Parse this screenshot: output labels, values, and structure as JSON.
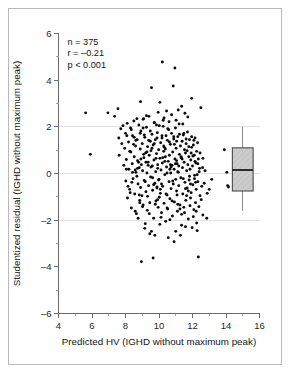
{
  "figure": {
    "border_color": "#b9b9b9",
    "background": "#ffffff"
  },
  "annotations": {
    "n_label": "n = 375",
    "r_label": "r = –0.21",
    "p_label": "p < 0.001"
  },
  "chart_data": {
    "type": "scatter",
    "title": "",
    "subtitle": "",
    "xlabel": "Predicted HV (IGHD without maximum peak)",
    "ylabel": "Studentized residual (IGHD without maximum peak)",
    "xlim": [
      4,
      16
    ],
    "ylim": [
      -6,
      6
    ],
    "xticks": [
      4,
      6,
      8,
      10,
      12,
      14,
      16
    ],
    "xtick_labels": [
      "4",
      "6",
      "8",
      "10",
      "12",
      "14",
      "16"
    ],
    "xminor_ticks": [
      5,
      7,
      9,
      11,
      13,
      15
    ],
    "yticks": [
      -6,
      -4,
      -2,
      0,
      2,
      4,
      6
    ],
    "ytick_labels": [
      "–6",
      "–4",
      "–2",
      "0",
      "2",
      "4",
      "6"
    ],
    "yminor_ticks": [
      -5,
      -3,
      -1,
      1,
      3,
      5
    ],
    "grid": true,
    "gridlines_y": [
      2,
      0,
      -2
    ],
    "legend": "none",
    "n": 375,
    "correlation_r": -0.21,
    "p_value": "< 0.001",
    "point_color": "#0a0a0a",
    "point_radius": 1.45,
    "annotations_text": [
      "n = 375",
      "r = –0.21",
      "p < 0.001"
    ],
    "boxplot": {
      "x_position": 15.0,
      "half_width": 0.62,
      "min_whisker": -1.62,
      "q1": -0.75,
      "median": 0.15,
      "q3": 1.1,
      "max_whisker": 2.0,
      "fill": "#c9c9c9",
      "hatch": "diagonal",
      "edge_color": "#4a4a4a"
    },
    "points": [
      [
        5.62,
        2.6
      ],
      [
        5.9,
        0.82
      ],
      [
        6.95,
        2.6
      ],
      [
        7.35,
        2.45
      ],
      [
        7.55,
        2.78
      ],
      [
        7.6,
        1.52
      ],
      [
        7.62,
        0.78
      ],
      [
        7.78,
        1.28
      ],
      [
        7.85,
        2.05
      ],
      [
        7.9,
        0.35
      ],
      [
        7.95,
        1.08
      ],
      [
        8.0,
        1.72
      ],
      [
        8.02,
        -0.32
      ],
      [
        8.05,
        0.6
      ],
      [
        8.1,
        2.15
      ],
      [
        8.12,
        -1.05
      ],
      [
        8.18,
        1.35
      ],
      [
        8.2,
        0.18
      ],
      [
        8.25,
        -0.68
      ],
      [
        8.3,
        1.95
      ],
      [
        8.32,
        0.92
      ],
      [
        8.35,
        -1.48
      ],
      [
        8.4,
        0.42
      ],
      [
        8.42,
        1.62
      ],
      [
        8.45,
        -0.22
      ],
      [
        8.5,
        2.25
      ],
      [
        8.52,
        0.72
      ],
      [
        8.55,
        -0.88
      ],
      [
        8.6,
        1.18
      ],
      [
        8.62,
        0.05
      ],
      [
        8.65,
        -1.72
      ],
      [
        8.7,
        1.45
      ],
      [
        8.72,
        0.55
      ],
      [
        8.75,
        -0.45
      ],
      [
        8.8,
        2.08
      ],
      [
        8.82,
        0.25
      ],
      [
        8.85,
        -1.15
      ],
      [
        8.88,
        1.05
      ],
      [
        8.9,
        -0.6
      ],
      [
        8.92,
        1.82
      ],
      [
        8.95,
        0.38
      ],
      [
        8.98,
        -0.95
      ],
      [
        9.0,
        1.28
      ],
      [
        9.02,
        0.12
      ],
      [
        9.05,
        -1.35
      ],
      [
        9.08,
        2.35
      ],
      [
        9.1,
        0.68
      ],
      [
        9.12,
        -0.3
      ],
      [
        9.15,
        1.55
      ],
      [
        9.18,
        -2.15
      ],
      [
        9.2,
        0.88
      ],
      [
        9.22,
        -0.78
      ],
      [
        9.25,
        1.98
      ],
      [
        9.28,
        0.02
      ],
      [
        9.3,
        -1.58
      ],
      [
        9.32,
        1.15
      ],
      [
        9.35,
        0.48
      ],
      [
        9.38,
        -0.52
      ],
      [
        9.4,
        2.45
      ],
      [
        9.42,
        0.78
      ],
      [
        9.45,
        -1.25
      ],
      [
        9.48,
        1.38
      ],
      [
        9.5,
        -0.15
      ],
      [
        9.52,
        0.98
      ],
      [
        9.55,
        -2.48
      ],
      [
        9.58,
        1.68
      ],
      [
        9.6,
        0.32
      ],
      [
        9.62,
        -0.72
      ],
      [
        9.65,
        1.22
      ],
      [
        9.68,
        -1.92
      ],
      [
        9.7,
        0.58
      ],
      [
        9.72,
        2.18
      ],
      [
        9.75,
        -0.42
      ],
      [
        9.78,
        1.45
      ],
      [
        9.8,
        0.08
      ],
      [
        9.82,
        -1.18
      ],
      [
        9.85,
        0.85
      ],
      [
        9.88,
        -0.62
      ],
      [
        9.9,
        1.75
      ],
      [
        9.92,
        0.22
      ],
      [
        9.95,
        -1.45
      ],
      [
        9.98,
        1.02
      ],
      [
        10.0,
        -0.25
      ],
      [
        10.02,
        2.05
      ],
      [
        10.05,
        0.65
      ],
      [
        10.08,
        -0.85
      ],
      [
        10.1,
        1.32
      ],
      [
        10.12,
        0.15
      ],
      [
        10.15,
        -1.68
      ],
      [
        10.18,
        1.52
      ],
      [
        10.2,
        0.45
      ],
      [
        10.22,
        -0.55
      ],
      [
        10.25,
        2.28
      ],
      [
        10.28,
        0.95
      ],
      [
        10.3,
        -1.28
      ],
      [
        10.32,
        1.12
      ],
      [
        10.35,
        -0.05
      ],
      [
        10.38,
        0.72
      ],
      [
        10.4,
        -2.05
      ],
      [
        10.42,
        1.62
      ],
      [
        10.45,
        0.28
      ],
      [
        10.48,
        -0.92
      ],
      [
        10.5,
        1.42
      ],
      [
        10.52,
        -1.52
      ],
      [
        10.55,
        0.52
      ],
      [
        10.58,
        1.88
      ],
      [
        10.6,
        -0.35
      ],
      [
        10.62,
        0.78
      ],
      [
        10.65,
        -1.08
      ],
      [
        10.68,
        1.25
      ],
      [
        10.7,
        0.02
      ],
      [
        10.72,
        -0.65
      ],
      [
        10.75,
        1.72
      ],
      [
        10.78,
        0.35
      ],
      [
        10.8,
        -1.82
      ],
      [
        10.82,
        0.92
      ],
      [
        10.85,
        -0.45
      ],
      [
        10.88,
        1.48
      ],
      [
        10.9,
        0.18
      ],
      [
        10.92,
        -1.22
      ],
      [
        10.95,
        0.62
      ],
      [
        10.98,
        1.95
      ],
      [
        11.0,
        -0.25
      ],
      [
        11.02,
        1.08
      ],
      [
        11.05,
        -0.75
      ],
      [
        11.08,
        0.42
      ],
      [
        11.1,
        -1.62
      ],
      [
        11.12,
        1.58
      ],
      [
        11.15,
        0.05
      ],
      [
        11.18,
        -0.52
      ],
      [
        11.2,
        2.12
      ],
      [
        11.22,
        0.82
      ],
      [
        11.25,
        -1.35
      ],
      [
        11.28,
        1.18
      ],
      [
        11.3,
        -0.18
      ],
      [
        11.32,
        0.68
      ],
      [
        11.35,
        -2.22
      ],
      [
        11.38,
        1.38
      ],
      [
        11.4,
        0.25
      ],
      [
        11.42,
        -0.88
      ],
      [
        11.45,
        1.65
      ],
      [
        11.48,
        -1.45
      ],
      [
        11.5,
        0.48
      ],
      [
        11.52,
        1.02
      ],
      [
        11.55,
        -0.38
      ],
      [
        11.58,
        0.88
      ],
      [
        11.6,
        -1.15
      ],
      [
        11.62,
        1.28
      ],
      [
        11.65,
        0.12
      ],
      [
        11.68,
        -0.62
      ],
      [
        11.7,
        1.78
      ],
      [
        11.72,
        0.38
      ],
      [
        11.75,
        -1.95
      ],
      [
        11.78,
        0.72
      ],
      [
        11.8,
        -0.28
      ],
      [
        11.82,
        1.45
      ],
      [
        11.85,
        0.18
      ],
      [
        11.88,
        -1.05
      ],
      [
        11.9,
        0.58
      ],
      [
        11.92,
        -0.82
      ],
      [
        11.95,
        1.12
      ],
      [
        11.98,
        -2.32
      ],
      [
        12.0,
        0.32
      ],
      [
        12.02,
        -0.48
      ],
      [
        12.05,
        1.22
      ],
      [
        12.08,
        -1.55
      ],
      [
        12.1,
        0.78
      ],
      [
        12.12,
        -0.08
      ],
      [
        12.15,
        1.52
      ],
      [
        12.18,
        -1.25
      ],
      [
        12.2,
        0.45
      ],
      [
        12.22,
        -0.68
      ],
      [
        12.25,
        0.95
      ],
      [
        12.28,
        -2.45
      ],
      [
        12.3,
        1.32
      ],
      [
        12.32,
        -0.35
      ],
      [
        12.35,
        0.62
      ],
      [
        12.38,
        -1.42
      ],
      [
        12.4,
        0.08
      ],
      [
        12.45,
        -0.95
      ],
      [
        12.5,
        2.82
      ],
      [
        12.55,
        -0.55
      ],
      [
        12.6,
        0.25
      ],
      [
        12.62,
        -1.78
      ],
      [
        12.7,
        -0.42
      ],
      [
        12.85,
        -1.92
      ],
      [
        13.0,
        -0.68
      ],
      [
        13.9,
        1.02
      ],
      [
        14.05,
        0.05
      ],
      [
        14.1,
        -0.52
      ],
      [
        14.15,
        -0.58
      ],
      [
        10.2,
        4.78
      ],
      [
        10.95,
        4.52
      ],
      [
        10.85,
        3.75
      ],
      [
        9.55,
        3.68
      ],
      [
        11.95,
        3.22
      ],
      [
        10.05,
        3.05
      ],
      [
        8.9,
        3.08
      ],
      [
        11.35,
        2.88
      ],
      [
        11.15,
        2.72
      ],
      [
        10.45,
        2.68
      ],
      [
        9.95,
        2.62
      ],
      [
        11.55,
        2.58
      ],
      [
        10.75,
        2.52
      ],
      [
        9.25,
        2.48
      ],
      [
        11.72,
        2.42
      ],
      [
        10.3,
        2.38
      ],
      [
        9.05,
        2.32
      ],
      [
        11.02,
        2.28
      ],
      [
        10.6,
        2.22
      ],
      [
        9.72,
        2.18
      ],
      [
        11.42,
        2.12
      ],
      [
        8.95,
        -3.78
      ],
      [
        9.65,
        -3.62
      ],
      [
        12.35,
        -3.58
      ],
      [
        10.9,
        -2.92
      ],
      [
        10.55,
        -2.75
      ],
      [
        11.28,
        -2.65
      ],
      [
        9.45,
        -2.58
      ],
      [
        8.25,
        0.95
      ],
      [
        8.48,
        1.25
      ],
      [
        8.68,
        -0.12
      ],
      [
        8.78,
        0.48
      ],
      [
        9.12,
        1.65
      ],
      [
        9.32,
        -0.98
      ],
      [
        9.52,
        0.28
      ],
      [
        9.78,
        -1.32
      ],
      [
        9.88,
        1.52
      ],
      [
        10.08,
        -0.68
      ],
      [
        10.28,
        1.18
      ],
      [
        10.48,
        -1.48
      ],
      [
        10.68,
        0.38
      ],
      [
        10.88,
        1.58
      ],
      [
        11.08,
        -0.92
      ],
      [
        11.32,
        0.72
      ],
      [
        11.52,
        -1.68
      ],
      [
        11.68,
        0.98
      ],
      [
        11.88,
        -0.45
      ],
      [
        12.08,
        1.42
      ],
      [
        8.15,
        -0.55
      ],
      [
        8.35,
        1.88
      ],
      [
        8.58,
        0.15
      ],
      [
        8.85,
        -1.25
      ],
      [
        9.08,
        0.82
      ],
      [
        9.38,
        1.42
      ],
      [
        9.62,
        -0.18
      ],
      [
        9.82,
        0.65
      ],
      [
        10.12,
        -1.88
      ],
      [
        10.35,
        0.52
      ],
      [
        10.62,
        1.35
      ],
      [
        10.82,
        -0.32
      ],
      [
        11.05,
        0.55
      ],
      [
        11.25,
        -1.52
      ],
      [
        11.48,
        1.72
      ],
      [
        11.75,
        -0.75
      ],
      [
        11.92,
        0.88
      ],
      [
        12.12,
        -0.22
      ],
      [
        12.32,
        0.42
      ],
      [
        12.52,
        -1.12
      ],
      [
        8.05,
        0.18
      ],
      [
        8.28,
        -0.82
      ],
      [
        8.52,
        1.55
      ],
      [
        8.72,
        0.22
      ],
      [
        9.02,
        -1.42
      ],
      [
        9.28,
        0.92
      ],
      [
        9.48,
        1.82
      ],
      [
        9.68,
        -0.48
      ],
      [
        9.92,
        0.38
      ],
      [
        10.18,
        1.62
      ],
      [
        10.42,
        -0.88
      ],
      [
        10.65,
        0.18
      ],
      [
        10.92,
        1.25
      ],
      [
        11.12,
        -1.32
      ],
      [
        11.38,
        0.62
      ],
      [
        11.62,
        1.48
      ],
      [
        11.82,
        -0.12
      ],
      [
        12.02,
        0.75
      ],
      [
        12.22,
        -1.62
      ],
      [
        12.42,
        0.22
      ],
      [
        8.42,
        0.05
      ],
      [
        8.62,
        1.42
      ],
      [
        8.82,
        -0.92
      ],
      [
        9.22,
        0.48
      ],
      [
        9.42,
        -1.72
      ],
      [
        9.72,
        1.28
      ],
      [
        9.98,
        -0.28
      ],
      [
        10.22,
        0.68
      ],
      [
        10.52,
        1.92
      ],
      [
        10.78,
        -1.18
      ],
      [
        11.18,
        0.32
      ],
      [
        11.58,
        -0.65
      ],
      [
        11.78,
        1.15
      ],
      [
        12.18,
        -0.38
      ],
      [
        12.45,
        0.88
      ],
      [
        8.92,
        0.62
      ],
      [
        9.18,
        -0.35
      ],
      [
        9.58,
        1.08
      ],
      [
        10.02,
        -1.02
      ],
      [
        10.72,
        0.28
      ],
      [
        11.22,
        1.68
      ],
      [
        11.65,
        -0.95
      ],
      [
        12.28,
        -0.05
      ],
      [
        8.38,
        -0.38
      ],
      [
        8.88,
        1.72
      ],
      [
        9.88,
        -0.58
      ],
      [
        10.38,
        1.05
      ],
      [
        11.45,
        -0.22
      ],
      [
        12.15,
        0.52
      ],
      [
        9.35,
        0.35
      ],
      [
        10.15,
        -0.45
      ],
      [
        10.98,
        0.42
      ],
      [
        11.85,
        -1.38
      ],
      [
        8.58,
        -1.62
      ],
      [
        9.15,
        -2.35
      ],
      [
        10.05,
        -2.18
      ],
      [
        11.0,
        -2.48
      ],
      [
        11.58,
        -2.28
      ],
      [
        12.25,
        -2.12
      ],
      [
        9.75,
        -2.65
      ],
      [
        10.65,
        -1.98
      ],
      [
        11.35,
        -1.75
      ],
      [
        8.75,
        -1.92
      ],
      [
        12.05,
        -1.85
      ],
      [
        9.05,
        1.95
      ],
      [
        10.25,
        2.02
      ],
      [
        11.05,
        1.38
      ],
      [
        11.95,
        1.58
      ],
      [
        8.68,
        2.35
      ],
      [
        9.85,
        2.08
      ],
      [
        12.62,
        0.65
      ],
      [
        12.75,
        0.12
      ],
      [
        13.15,
        -0.25
      ],
      [
        7.72,
        1.92
      ],
      [
        8.08,
        1.62
      ],
      [
        12.88,
        -0.85
      ],
      [
        10.48,
        0.02
      ],
      [
        9.92,
        -1.12
      ],
      [
        11.12,
        0.08
      ]
    ]
  }
}
